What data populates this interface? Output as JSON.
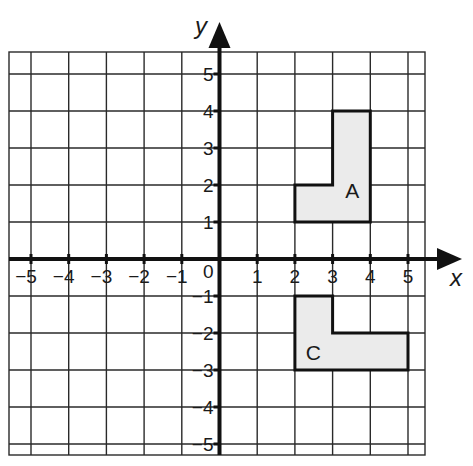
{
  "diagram": {
    "type": "coordinate-grid",
    "x_axis": {
      "label": "x",
      "min": -5,
      "max": 5,
      "ticks": [
        -5,
        -4,
        -3,
        -2,
        -1,
        1,
        2,
        3,
        4,
        5
      ]
    },
    "y_axis": {
      "label": "y",
      "min": -5,
      "max": 5,
      "ticks": [
        5,
        4,
        3,
        2,
        1,
        -1,
        -2,
        -3,
        -4,
        -5
      ]
    },
    "origin_label": "0",
    "shapes": [
      {
        "name": "A",
        "label": "A",
        "vertices": [
          [
            2,
            1
          ],
          [
            4,
            1
          ],
          [
            4,
            4
          ],
          [
            3,
            4
          ],
          [
            3,
            2
          ],
          [
            2,
            2
          ]
        ],
        "label_position": [
          3.55,
          1.6
        ]
      },
      {
        "name": "C",
        "label": "C",
        "vertices": [
          [
            2,
            -1
          ],
          [
            3,
            -1
          ],
          [
            3,
            -2
          ],
          [
            5,
            -2
          ],
          [
            5,
            -3
          ],
          [
            2,
            -3
          ]
        ],
        "label_position": [
          2.5,
          -2.5
        ]
      }
    ],
    "colors": {
      "grid": "#2a2a2a",
      "axis": "#111111",
      "shape_fill": "#ebebeb",
      "shape_stroke": "#111111"
    }
  },
  "labels": {
    "x_ticks": [
      "−5",
      "−4",
      "−3",
      "−2",
      "−1",
      "1",
      "2",
      "3",
      "4",
      "5"
    ],
    "y_ticks": [
      "5",
      "4",
      "3",
      "2",
      "1",
      "−1",
      "−2",
      "−3",
      "−4",
      "−5"
    ],
    "origin": "0",
    "x_title": "x",
    "y_title": "y",
    "shape_a": "A",
    "shape_c": "C"
  }
}
